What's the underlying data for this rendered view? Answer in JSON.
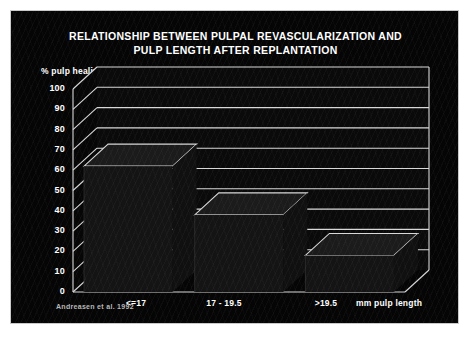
{
  "slide": {
    "title_line1": "RELATIONSHIP BETWEEN PULPAL REVASCULARIZATION AND",
    "title_line2": "PULP LENGTH AFTER REPLANTATION",
    "source": "Andreasen et al. 1992",
    "background_color": "#050505",
    "text_color": "#ffffff",
    "grid_color": "#d8d8d8",
    "bar_color": "#141414"
  },
  "chart_data": {
    "type": "bar",
    "title": "RELATIONSHIP BETWEEN PULPAL REVASCULARIZATION AND PULP LENGTH AFTER REPLANTATION",
    "categories": [
      "<=17",
      "17 - 19.5",
      ">19.5"
    ],
    "values": [
      62,
      38,
      18
    ],
    "series": [
      {
        "name": "% pulp healing",
        "values": [
          62,
          38,
          18
        ]
      }
    ],
    "xlabel": "mm pulp length",
    "ylabel": "% pulp healing",
    "ylim": [
      0,
      100
    ],
    "yticks": [
      0,
      10,
      20,
      30,
      40,
      50,
      60,
      70,
      80,
      90,
      100
    ],
    "ytick_labels": [
      "0",
      "10",
      "20",
      "30",
      "40",
      "50",
      "60",
      "70",
      "80",
      "90",
      "100"
    ],
    "grid": true,
    "legend": "none",
    "style": "3d-perspective",
    "annotation": "Andreasen et al. 1992"
  }
}
